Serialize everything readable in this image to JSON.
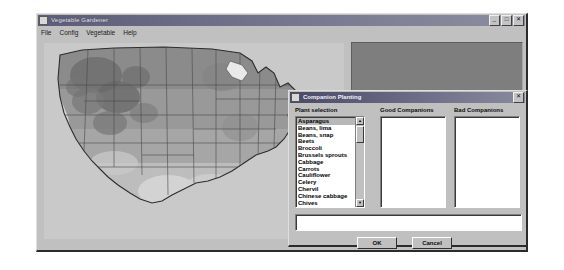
{
  "app_window": {
    "title": "Vegetable Gardener",
    "icon": "window-icon",
    "controls": {
      "minimize": "_",
      "maximize": "□",
      "close": "✕"
    },
    "menu": [
      {
        "label": "File"
      },
      {
        "label": "Config"
      },
      {
        "label": "Vegetable"
      },
      {
        "label": "Help"
      }
    ],
    "map": {
      "name": "usa-hardiness-zone-map",
      "description": "Grayscale map of the contiguous United States showing shaded climate/hardiness zones with state borders"
    },
    "info_panel": {
      "content": ""
    }
  },
  "dialog": {
    "title": "Companion Planting",
    "icon": "window-icon",
    "close_label": "✕",
    "plant_selection": {
      "label": "Plant selection",
      "selected": "Asparagus",
      "items": [
        "Asparagus",
        "Beans, lima",
        "Beans, snap",
        "Beets",
        "Broccoli",
        "Brussels sprouts",
        "Cabbage",
        "Carrots",
        "Cauliflower",
        "Celery",
        "Chervil",
        "Chinese cabbage",
        "Chives"
      ],
      "scrollbar": {
        "up_arrow": "▲",
        "down_arrow": "▼"
      }
    },
    "good_companions": {
      "label": "Good Companions",
      "items": []
    },
    "bad_companions": {
      "label": "Bad Companions",
      "items": []
    },
    "notes": {
      "value": "",
      "placeholder": ""
    },
    "buttons": {
      "ok": "OK",
      "cancel": "Cancel"
    }
  },
  "colors": {
    "face": "#c0c0c0",
    "titlebar_active": "#5c5c78",
    "desktop": "#ffffff",
    "field_bg": "#ffffff",
    "panel_dark": "#7e7e7e"
  }
}
